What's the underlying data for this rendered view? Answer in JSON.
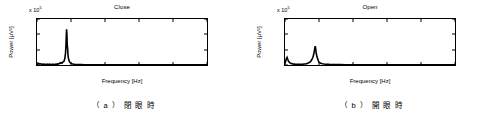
{
  "figure": {
    "panels": [
      {
        "id": "panel-a",
        "caption": "（ a ）  閉  眼  時",
        "chart_data": {
          "type": "line",
          "title": "Close",
          "xlabel": "Frequency [Hz]",
          "ylabel": "Power [μV²]",
          "y_exponent_label": "x 10",
          "y_exponent_value": "5",
          "xlim": [
            0,
            50
          ],
          "ylim": [
            0,
            6
          ],
          "xticks": [
            0,
            10,
            20,
            30,
            40,
            50
          ],
          "yticks": [
            0,
            2,
            4,
            6
          ],
          "grid": false,
          "legend": null,
          "series": [
            {
              "name": "Close",
              "x": [
                0.0,
                0.2,
                0.4,
                0.6,
                0.8,
                1.0,
                1.2,
                1.4,
                1.6,
                1.8,
                2.0,
                2.2,
                2.4,
                2.6,
                2.8,
                3.0,
                3.2,
                3.4,
                3.6,
                3.8,
                4.0,
                4.2,
                4.4,
                4.6,
                4.8,
                5.0,
                5.2,
                5.4,
                5.6,
                5.8,
                6.0,
                6.2,
                6.4,
                6.6,
                6.8,
                7.0,
                7.2,
                7.4,
                7.6,
                7.8,
                8.0,
                8.2,
                8.4,
                8.5,
                8.6,
                8.7,
                8.8,
                8.9,
                9.0,
                9.1,
                9.2,
                9.4,
                9.6,
                9.8,
                10.0,
                10.2,
                10.4,
                10.6,
                10.8,
                11.0,
                11.5,
                12.0,
                12.5,
                13.0,
                14.0,
                15.0,
                16.0,
                17.0,
                18.0,
                20.0,
                22.0,
                25.0,
                28.0,
                30.0,
                33.0,
                36.0,
                40.0,
                44.0,
                47.0,
                50.0
              ],
              "y": [
                0.05,
                0.12,
                0.22,
                0.18,
                0.14,
                0.16,
                0.12,
                0.1,
                0.13,
                0.09,
                0.11,
                0.08,
                0.1,
                0.07,
                0.09,
                0.12,
                0.08,
                0.07,
                0.1,
                0.06,
                0.08,
                0.07,
                0.09,
                0.06,
                0.08,
                0.1,
                0.07,
                0.09,
                0.12,
                0.1,
                0.14,
                0.11,
                0.16,
                0.2,
                0.28,
                0.22,
                0.3,
                0.26,
                0.38,
                0.45,
                0.55,
                0.9,
                1.6,
                2.4,
                3.6,
                4.65,
                4.0,
                2.6,
                2.2,
                1.4,
                1.0,
                0.6,
                0.4,
                0.3,
                0.22,
                0.18,
                0.14,
                0.12,
                0.1,
                0.09,
                0.07,
                0.06,
                0.05,
                0.05,
                0.04,
                0.04,
                0.03,
                0.03,
                0.03,
                0.02,
                0.02,
                0.02,
                0.02,
                0.02,
                0.01,
                0.01,
                0.01,
                0.01,
                0.01,
                0.01
              ]
            }
          ]
        }
      },
      {
        "id": "panel-b",
        "caption": "（ b ）  開  眼  時",
        "chart_data": {
          "type": "line",
          "title": "Open",
          "xlabel": "Frequency [Hz]",
          "ylabel": "Power [μV²]",
          "y_exponent_label": "x 10",
          "y_exponent_value": "5",
          "xlim": [
            0,
            50
          ],
          "ylim": [
            0,
            6
          ],
          "xticks": [
            0,
            10,
            20,
            30,
            40,
            50
          ],
          "yticks": [
            0,
            2,
            4,
            6
          ],
          "grid": false,
          "legend": null,
          "series": [
            {
              "name": "Open",
              "x": [
                0.0,
                0.2,
                0.4,
                0.6,
                0.8,
                1.0,
                1.2,
                1.4,
                1.6,
                1.8,
                2.0,
                2.2,
                2.4,
                2.6,
                2.8,
                3.0,
                3.2,
                3.4,
                3.6,
                3.8,
                4.0,
                4.4,
                4.8,
                5.2,
                5.6,
                6.0,
                6.4,
                6.8,
                7.0,
                7.2,
                7.4,
                7.6,
                7.8,
                8.0,
                8.2,
                8.4,
                8.6,
                8.8,
                8.9,
                9.0,
                9.1,
                9.2,
                9.4,
                9.6,
                9.8,
                10.0,
                10.2,
                10.5,
                11.0,
                11.5,
                12.0,
                13.0,
                14.0,
                15.0,
                16.0,
                18.0,
                20.0,
                22.0,
                25.0,
                28.0,
                30.0,
                33.0,
                36.0,
                40.0,
                44.0,
                47.0,
                50.0
              ],
              "y": [
                0.2,
                0.5,
                0.85,
                1.0,
                0.75,
                0.55,
                0.4,
                0.3,
                0.25,
                0.2,
                0.18,
                0.15,
                0.14,
                0.12,
                0.12,
                0.1,
                0.1,
                0.09,
                0.09,
                0.08,
                0.08,
                0.08,
                0.09,
                0.1,
                0.12,
                0.14,
                0.18,
                0.25,
                0.3,
                0.35,
                0.4,
                0.5,
                0.65,
                0.8,
                1.0,
                1.3,
                1.75,
                2.3,
                2.45,
                2.2,
                1.8,
                1.5,
                1.1,
                0.8,
                0.55,
                0.4,
                0.3,
                0.22,
                0.16,
                0.12,
                0.1,
                0.08,
                0.07,
                0.06,
                0.05,
                0.04,
                0.03,
                0.03,
                0.02,
                0.02,
                0.02,
                0.02,
                0.01,
                0.01,
                0.01,
                0.01,
                0.01
              ]
            }
          ]
        }
      }
    ]
  }
}
